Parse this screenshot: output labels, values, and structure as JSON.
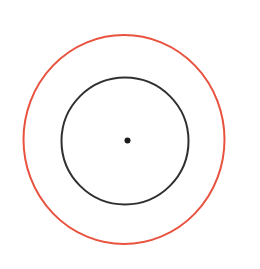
{
  "canvas": {
    "width": 260,
    "height": 269,
    "background": "#ffffff"
  },
  "diagram": {
    "outer_circle": {
      "cx": 124,
      "cy": 139.5,
      "rx": 100.5,
      "ry": 104.5,
      "stroke": "#e8523f",
      "stroke_width": 2,
      "fill": "none"
    },
    "inner_circle": {
      "cx": 125,
      "cy": 141,
      "r": 63.5,
      "stroke": "#2f2f2f",
      "stroke_width": 2,
      "fill": "none"
    },
    "center_dot": {
      "cx": 127.5,
      "cy": 140.5,
      "r": 3,
      "fill": "#1c1c1c"
    }
  }
}
